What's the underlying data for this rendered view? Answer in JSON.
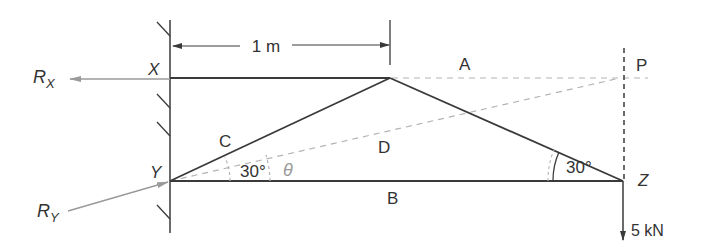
{
  "diagram": {
    "type": "truss_force_diagram",
    "colors": {
      "member": "#3a3a3a",
      "construction_dashed": "#b4b4b4",
      "reaction_arrow": "#9a9a9a",
      "text": "#333333",
      "theta": "#999999"
    },
    "nodes": {
      "X": {
        "label": "X",
        "x": 170,
        "y": 78
      },
      "Y": {
        "label": "Y",
        "x": 170,
        "y": 181
      },
      "Z": {
        "label": "Z",
        "x": 623,
        "y": 181
      },
      "apex": {
        "x": 390,
        "y": 78
      },
      "P": {
        "label": "P",
        "x": 624,
        "y": 78
      }
    },
    "members": [
      {
        "from": "X",
        "to": "apex"
      },
      {
        "from": "Y",
        "to": "apex"
      },
      {
        "from": "apex",
        "to": "Z"
      },
      {
        "from": "Y",
        "to": "Z"
      }
    ],
    "region_labels": {
      "A": "A",
      "B": "B",
      "C": "C",
      "D": "D"
    },
    "dimension": {
      "label": "1 m"
    },
    "angles": {
      "at_Y": "30°",
      "at_Z": "30°",
      "theta": "θ"
    },
    "reactions": {
      "RX": {
        "main": "R",
        "sub": "X"
      },
      "RY": {
        "main": "R",
        "sub": "Y"
      }
    },
    "load": {
      "label": "5 kN"
    }
  }
}
